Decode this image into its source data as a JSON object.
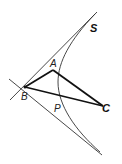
{
  "diagram": {
    "type": "geometry-figure",
    "labels": {
      "S": "S",
      "A": "A",
      "B": "B",
      "P": "P",
      "C": "C"
    },
    "points": {
      "A": [
        53,
        70
      ],
      "B": [
        25,
        87
      ],
      "P": [
        60,
        93
      ],
      "C": [
        103,
        106
      ]
    },
    "colors": {
      "stroke": "#222222",
      "background": "#ffffff"
    }
  }
}
